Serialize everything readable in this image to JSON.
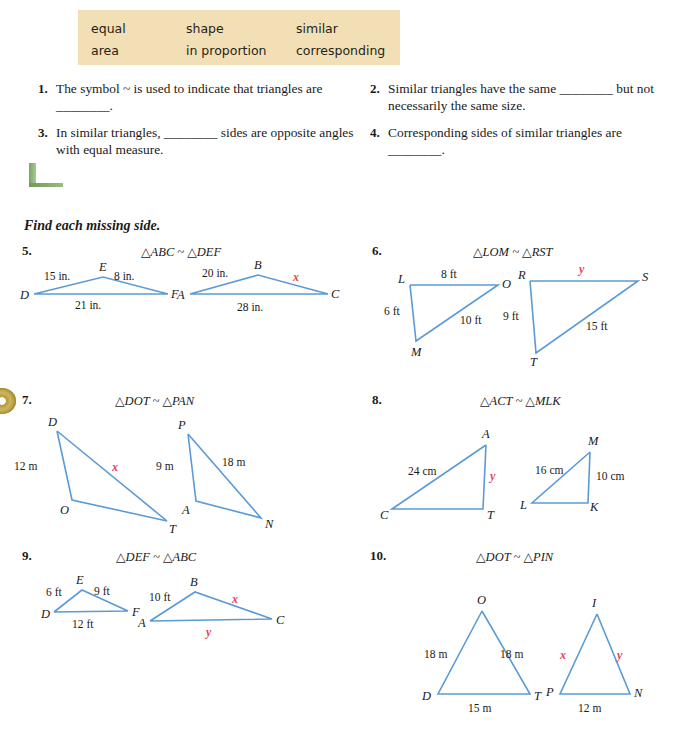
{
  "colors": {
    "wordbank_bg": "#f2dfb6",
    "figure_stroke": "#5b9bd5",
    "variable_red": "#e2445c",
    "green_accent": "#7aa563",
    "cd_gold": "#b59a36"
  },
  "word_bank": {
    "column1": [
      "equal",
      "area"
    ],
    "column2": [
      "shape",
      "in proportion"
    ],
    "column3": [
      "similar",
      "corresponding"
    ]
  },
  "fill_in_questions": [
    {
      "number": "1.",
      "text": "The symbol ~ is used to indicate that triangles are ________."
    },
    {
      "number": "2.",
      "text": "Similar triangles have the same ________ but not necessarily the same size."
    },
    {
      "number": "3.",
      "text": "In similar triangles, ________ sides are opposite angles with equal measure."
    },
    {
      "number": "4.",
      "text": "Corresponding sides of similar triangles are ________."
    }
  ],
  "section_heading": "Find each missing side.",
  "problems": [
    {
      "number": "5.",
      "statement": "△ABC ~ △DEF",
      "left_triangle": {
        "vertices": [
          "D",
          "E",
          "F"
        ],
        "side_labels": [
          "15 in.",
          "8 in.",
          "21 in."
        ]
      },
      "right_triangle": {
        "vertices": [
          "A",
          "B",
          "C"
        ],
        "side_labels": [
          "20 in.",
          "x",
          "28 in."
        ]
      }
    },
    {
      "number": "6.",
      "statement": "△LOM ~ △RST",
      "left_triangle": {
        "vertices": [
          "L",
          "O",
          "M"
        ],
        "side_labels": [
          "8 ft",
          "6 ft",
          "10 ft"
        ]
      },
      "right_triangle": {
        "vertices": [
          "R",
          "S",
          "T"
        ],
        "side_labels": [
          "y",
          "9 ft",
          "15 ft"
        ]
      }
    },
    {
      "number": "7.",
      "statement": "△DOT ~ △PAN",
      "left_triangle": {
        "vertices": [
          "D",
          "O",
          "T"
        ],
        "side_labels": [
          "12 m",
          "x"
        ]
      },
      "right_triangle": {
        "vertices": [
          "P",
          "A",
          "N"
        ],
        "side_labels": [
          "9 m",
          "18 m"
        ]
      }
    },
    {
      "number": "8.",
      "statement": "△ACT ~ △MLK",
      "left_triangle": {
        "vertices": [
          "A",
          "C",
          "T"
        ],
        "side_labels": [
          "24 cm",
          "y"
        ]
      },
      "right_triangle": {
        "vertices": [
          "M",
          "L",
          "K"
        ],
        "side_labels": [
          "16 cm",
          "10 cm"
        ]
      }
    },
    {
      "number": "9.",
      "statement": "△DEF ~ △ABC",
      "left_triangle": {
        "vertices": [
          "D",
          "E",
          "F"
        ],
        "side_labels": [
          "6 ft",
          "9 ft",
          "12 ft"
        ]
      },
      "right_triangle": {
        "vertices": [
          "A",
          "B",
          "C"
        ],
        "side_labels": [
          "10 ft",
          "x",
          "y"
        ]
      }
    },
    {
      "number": "10.",
      "statement": "△DOT ~ △PIN",
      "left_triangle": {
        "vertices": [
          "O",
          "D",
          "T"
        ],
        "side_labels": [
          "18 m",
          "18 m",
          "15 m"
        ]
      },
      "right_triangle": {
        "vertices": [
          "I",
          "P",
          "N"
        ],
        "side_labels": [
          "x",
          "y",
          "12 m"
        ]
      }
    }
  ]
}
